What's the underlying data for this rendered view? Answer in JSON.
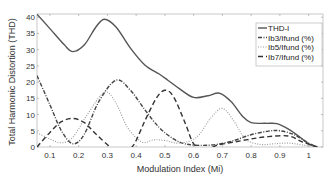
{
  "chart_data": {
    "type": "line",
    "title": "",
    "xlabel": "Modulation Index (Mi)",
    "ylabel": "Total Harmonic Distortion (THD)",
    "xlim": [
      0.055,
      1.05
    ],
    "ylim": [
      0,
      41
    ],
    "xticks": [
      0.1,
      0.2,
      0.3,
      0.4,
      0.5,
      0.6,
      0.7,
      0.8,
      0.9,
      1
    ],
    "xtick_labels": [
      "0.1",
      "0.2",
      "0.3",
      "0.4",
      "0.5",
      "0.6",
      "0.7",
      "0.8",
      "0.9",
      "1"
    ],
    "yticks": [
      0,
      5,
      10,
      15,
      20,
      25,
      30,
      35,
      40
    ],
    "ytick_labels": [
      "0",
      "5",
      "10",
      "15",
      "20",
      "25",
      "30",
      "35",
      "40"
    ],
    "grid": false,
    "legend_position": "upper right",
    "series": [
      {
        "name": "THD-I",
        "style": "solid",
        "color": "#555555",
        "x": [
          0.055,
          0.1,
          0.15,
          0.18,
          0.22,
          0.26,
          0.29,
          0.33,
          0.38,
          0.43,
          0.48,
          0.51,
          0.55,
          0.6,
          0.65,
          0.69,
          0.73,
          0.77,
          0.8,
          0.85,
          0.89,
          0.93,
          0.97,
          1.0,
          1.03
        ],
        "y": [
          40.9,
          36.5,
          31.5,
          29.4,
          31.5,
          37.0,
          39.4,
          37.0,
          30.5,
          25.3,
          22.5,
          20.6,
          18.0,
          15.3,
          15.8,
          16.6,
          14.0,
          9.5,
          7.5,
          7.3,
          7.2,
          5.5,
          3.0,
          1.0,
          0.0
        ]
      },
      {
        "name": "Ib3/Ifund (%)",
        "style": "dashdot",
        "color": "#444444",
        "x": [
          0.055,
          0.1,
          0.14,
          0.18,
          0.22,
          0.27,
          0.33,
          0.38,
          0.43,
          0.48,
          0.53,
          0.57,
          0.62,
          0.68,
          0.74,
          0.8,
          0.86,
          0.9,
          0.95,
          1.0,
          1.03
        ],
        "y": [
          22.0,
          13.0,
          5.0,
          1.0,
          4.0,
          14.0,
          20.6,
          17.5,
          11.5,
          6.0,
          2.5,
          1.0,
          0.5,
          0.8,
          2.0,
          3.8,
          4.9,
          5.0,
          3.8,
          1.2,
          0.0
        ]
      },
      {
        "name": "Ib5/Ifund (%)",
        "style": "dotted",
        "color": "#999999",
        "x": [
          0.055,
          0.1,
          0.14,
          0.18,
          0.23,
          0.29,
          0.33,
          0.37,
          0.42,
          0.46,
          0.5,
          0.55,
          0.61,
          0.66,
          0.7,
          0.74,
          0.78,
          0.83,
          0.88,
          0.93,
          0.98,
          1.03
        ],
        "y": [
          4.4,
          2.5,
          1.3,
          3.0,
          10.0,
          16.9,
          13.5,
          6.0,
          1.5,
          2.2,
          2.0,
          1.2,
          3.0,
          9.0,
          11.9,
          8.0,
          2.5,
          0.8,
          1.0,
          1.2,
          0.6,
          0.0
        ]
      },
      {
        "name": "Ib7/Ifund (%)",
        "style": "dashed",
        "color": "#333333",
        "x": [
          0.055,
          0.1,
          0.14,
          0.18,
          0.22,
          0.26,
          0.31,
          0.35,
          0.39,
          0.43,
          0.47,
          0.5,
          0.53,
          0.57,
          0.6,
          0.64,
          0.68,
          0.74,
          0.8,
          0.86,
          0.93,
          0.98,
          1.03
        ],
        "y": [
          0.0,
          4.5,
          7.8,
          8.8,
          7.5,
          4.0,
          0.0,
          -2.0,
          0.5,
          8.0,
          15.0,
          17.5,
          15.5,
          7.5,
          1.0,
          -1.0,
          0.5,
          1.5,
          2.5,
          3.2,
          3.4,
          1.5,
          0.0
        ]
      }
    ]
  },
  "legend": {
    "items": [
      "THD-I",
      "Ib3/Ifund (%)",
      "Ib5/Ifund (%)",
      "Ib7/Ifund (%)"
    ]
  },
  "axes": {
    "xlabel": "Modulation Index (Mi)",
    "ylabel": "Total Harmonic Distortion (THD)"
  }
}
